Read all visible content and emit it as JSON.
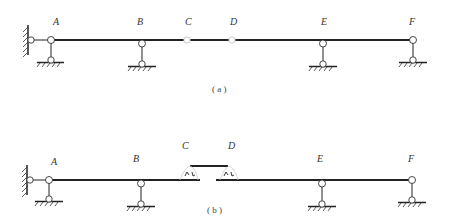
{
  "figure_a": {
    "caption": "( a )",
    "nodes": {
      "A": "A",
      "B": "B",
      "C": "C",
      "D": "D",
      "E": "E",
      "F": "F"
    }
  },
  "figure_b": {
    "caption": "( b )",
    "nodes": {
      "A": "A",
      "B": "B",
      "C": "C",
      "D": "D",
      "E": "E",
      "F": "F"
    }
  },
  "colors": {
    "line": "#222222",
    "node_fill": "#ffffff",
    "label": "#333333"
  }
}
